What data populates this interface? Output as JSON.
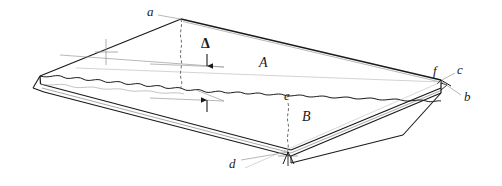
{
  "figure": {
    "background_color": "#ffffff",
    "line_color": "#1a1a1a",
    "leader_color": "#8c8c8c",
    "width": 502,
    "height": 186
  },
  "labels": {
    "a": "a",
    "b": "b",
    "c": "c",
    "d": "d",
    "e": "e",
    "f": "f",
    "region_A": "A",
    "region_B": "B",
    "delta": "Δ"
  },
  "annotations": [
    {
      "key": "a",
      "text": "a",
      "x": 148,
      "y": 11,
      "target": "top-apex-vertex"
    },
    {
      "key": "delta",
      "text": "Δ",
      "x": 202,
      "y": 45,
      "target": "gap-dimension"
    },
    {
      "key": "region_A",
      "text": "A",
      "x": 262,
      "y": 63,
      "target": "upper-surface-region"
    },
    {
      "key": "f",
      "text": "f",
      "x": 434,
      "y": 71,
      "target": "right-vertex"
    },
    {
      "key": "c",
      "text": "c",
      "x": 458,
      "y": 70,
      "target": "right-vertex-upper-edge"
    },
    {
      "key": "b",
      "text": "b",
      "x": 465,
      "y": 97,
      "target": "right-vertex-lower-edge"
    },
    {
      "key": "e",
      "text": "e",
      "x": 286,
      "y": 96,
      "target": "fracture-line-point"
    },
    {
      "key": "region_B",
      "text": "B",
      "x": 305,
      "y": 117,
      "target": "lower-surface-region"
    },
    {
      "key": "d",
      "text": "d",
      "x": 231,
      "y": 164,
      "target": "front-bottom-corner"
    }
  ],
  "geometry": {
    "top_apex": [
      181,
      19
    ],
    "left_vertex": [
      40,
      76
    ],
    "right_vertex": [
      441,
      80
    ],
    "front_bottom_corner": [
      291,
      156
    ],
    "delta_line_upper_y": 67,
    "delta_line_lower_y": 101,
    "delta_x": 207
  }
}
